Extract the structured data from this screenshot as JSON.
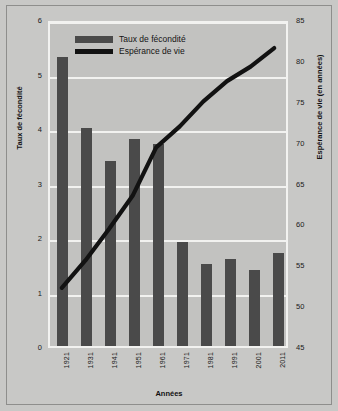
{
  "chart_data": {
    "type": "bar",
    "title": "",
    "xlabel": "Années",
    "ylabel": "Taux de fécondité",
    "y2label": "Espérance de vie (en années)",
    "categories": [
      "1921",
      "1931",
      "1941",
      "1951",
      "1961",
      "1971",
      "1981",
      "1991",
      "2001",
      "2011"
    ],
    "ylim": [
      0,
      6
    ],
    "yticks": [
      "0",
      "1",
      "2",
      "3",
      "4",
      "5",
      "6"
    ],
    "y2lim": [
      45,
      85
    ],
    "y2ticks": [
      "45",
      "50",
      "55",
      "60",
      "65",
      "70",
      "75",
      "80",
      "85"
    ],
    "grid": true,
    "legend_position": "top-center",
    "series": [
      {
        "name": "Taux de fécondité",
        "type": "bar",
        "axis": "left",
        "color": "#4a4a4a",
        "values": [
          5.3,
          4.0,
          3.4,
          3.8,
          3.7,
          1.9,
          1.5,
          1.6,
          1.4,
          1.7
        ]
      },
      {
        "name": "Espérance de vie",
        "type": "line",
        "axis": "right",
        "color": "#121212",
        "values": [
          52.2,
          55.6,
          59.5,
          63.6,
          69.6,
          72.2,
          75.3,
          77.8,
          79.6,
          81.9
        ]
      }
    ]
  },
  "legend": {
    "items": [
      {
        "label": "Taux de fécondité",
        "marker": "bar-swatch"
      },
      {
        "label": "Espérance de vie",
        "marker": "line-swatch"
      }
    ]
  }
}
